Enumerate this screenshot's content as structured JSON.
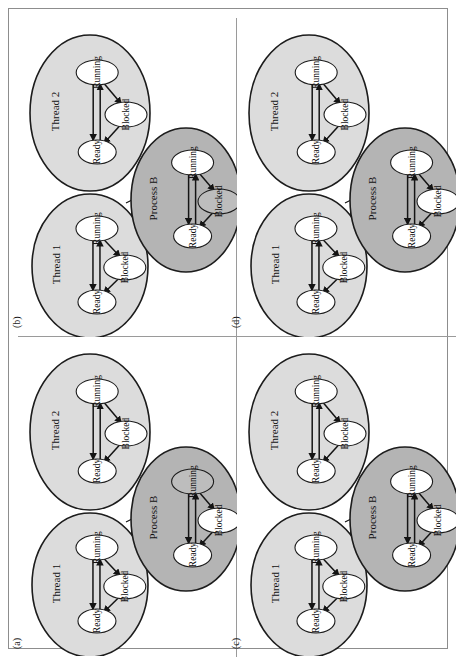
{
  "figure": {
    "caption_labels": [
      "(a)",
      "(b)",
      "(c)",
      "(d)"
    ],
    "orientation": "rotated-90-ccw",
    "group_labels": {
      "thread1": "Thread 1",
      "thread2": "Thread 2",
      "process": "Process B"
    },
    "state_labels": {
      "running": "Running",
      "ready": "Ready",
      "blocked": "Blocked"
    },
    "colors": {
      "thread_fill": "#dcdcdc",
      "process_fill": "#b4b4b4",
      "node_white": "#ffffff",
      "node_shaded": "#bdbdbd",
      "outline": "#1c1c1c",
      "frame": "#8d8d8d",
      "page_background": "#ffffff"
    }
  },
  "panels": [
    {
      "id": "b",
      "label": "(b)",
      "position": "top-left",
      "groups": [
        {
          "name": "Thread 1",
          "type": "thread",
          "states": [
            {
              "label": "Running",
              "highlighted": false
            },
            {
              "label": "Ready",
              "highlighted": false
            },
            {
              "label": "Blocked",
              "highlighted": false
            }
          ]
        },
        {
          "name": "Thread 2",
          "type": "thread",
          "states": [
            {
              "label": "Running",
              "highlighted": false
            },
            {
              "label": "Ready",
              "highlighted": false
            },
            {
              "label": "Blocked",
              "highlighted": false
            }
          ]
        },
        {
          "name": "Process B",
          "type": "process",
          "states": [
            {
              "label": "Running",
              "highlighted": false
            },
            {
              "label": "Ready",
              "highlighted": false
            },
            {
              "label": "Blocked",
              "highlighted": true
            }
          ]
        }
      ]
    },
    {
      "id": "d",
      "label": "(d)",
      "position": "top-right",
      "groups": [
        {
          "name": "Thread 1",
          "type": "thread",
          "states": [
            {
              "label": "Running",
              "highlighted": false
            },
            {
              "label": "Ready",
              "highlighted": false
            },
            {
              "label": "Blocked",
              "highlighted": false
            }
          ]
        },
        {
          "name": "Thread 2",
          "type": "thread",
          "states": [
            {
              "label": "Running",
              "highlighted": false
            },
            {
              "label": "Ready",
              "highlighted": false
            },
            {
              "label": "Blocked",
              "highlighted": false
            }
          ]
        },
        {
          "name": "Process B",
          "type": "process",
          "states": [
            {
              "label": "Running",
              "highlighted": false
            },
            {
              "label": "Ready",
              "highlighted": false
            },
            {
              "label": "Blocked",
              "highlighted": false
            }
          ]
        }
      ]
    },
    {
      "id": "a",
      "label": "(a)",
      "position": "bottom-left",
      "groups": [
        {
          "name": "Thread 1",
          "type": "thread",
          "states": [
            {
              "label": "Running",
              "highlighted": false
            },
            {
              "label": "Ready",
              "highlighted": false
            },
            {
              "label": "Blocked",
              "highlighted": false
            }
          ]
        },
        {
          "name": "Thread 2",
          "type": "thread",
          "states": [
            {
              "label": "Running",
              "highlighted": false
            },
            {
              "label": "Ready",
              "highlighted": false
            },
            {
              "label": "Blocked",
              "highlighted": false
            }
          ]
        },
        {
          "name": "Process B",
          "type": "process",
          "states": [
            {
              "label": "Running",
              "highlighted": true
            },
            {
              "label": "Ready",
              "highlighted": false
            },
            {
              "label": "Blocked",
              "highlighted": false
            }
          ]
        }
      ]
    },
    {
      "id": "c",
      "label": "(c)",
      "position": "bottom-right",
      "groups": [
        {
          "name": "Thread 1",
          "type": "thread",
          "states": [
            {
              "label": "Running",
              "highlighted": false
            },
            {
              "label": "Ready",
              "highlighted": false
            },
            {
              "label": "Blocked",
              "highlighted": false
            }
          ]
        },
        {
          "name": "Thread 2",
          "type": "thread",
          "states": [
            {
              "label": "Running",
              "highlighted": false
            },
            {
              "label": "Ready",
              "highlighted": false
            },
            {
              "label": "Blocked",
              "highlighted": false
            }
          ]
        },
        {
          "name": "Process B",
          "type": "process",
          "states": [
            {
              "label": "Running",
              "highlighted": false
            },
            {
              "label": "Ready",
              "highlighted": false
            },
            {
              "label": "Blocked",
              "highlighted": false
            }
          ]
        }
      ]
    }
  ]
}
